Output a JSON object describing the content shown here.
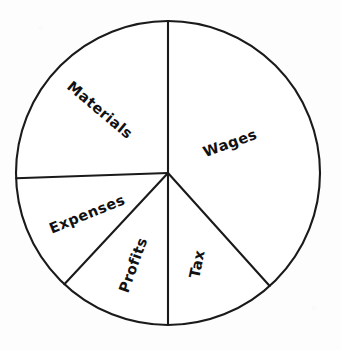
{
  "chart_data": {
    "type": "pie",
    "title": "",
    "subtitle": "",
    "xlabel": "",
    "ylabel": "",
    "grid": false,
    "legend_position": "none",
    "start_angle_deg": 0,
    "direction": "clockwise",
    "categories": [
      "Wages",
      "Tax",
      "Profits",
      "Expenses",
      "Materials"
    ],
    "values": [
      38.3,
      11.7,
      11.9,
      12.5,
      25.6
    ],
    "units": "percent",
    "slices": [
      {
        "label": "Wages",
        "value": 38.3,
        "start_angle_deg": 0,
        "end_angle_deg": 138,
        "sweep_deg": 138,
        "label_rotation_deg": -20,
        "label_x": 230,
        "label_y": 143
      },
      {
        "label": "Tax",
        "value": 11.7,
        "start_angle_deg": 138,
        "end_angle_deg": 180,
        "sweep_deg": 42,
        "label_rotation_deg": -78,
        "label_x": 197,
        "label_y": 264
      },
      {
        "label": "Profits",
        "value": 11.9,
        "start_angle_deg": 180,
        "end_angle_deg": 223,
        "sweep_deg": 43,
        "label_rotation_deg": -70,
        "label_x": 133,
        "label_y": 265
      },
      {
        "label": "Expenses",
        "value": 12.5,
        "start_angle_deg": 223,
        "end_angle_deg": 268,
        "sweep_deg": 45,
        "label_rotation_deg": -22,
        "label_x": 87,
        "label_y": 214
      },
      {
        "label": "Materials",
        "value": 25.6,
        "start_angle_deg": 268,
        "end_angle_deg": 360,
        "sweep_deg": 92,
        "label_rotation_deg": 40,
        "label_x": 100,
        "label_y": 110
      }
    ],
    "geometry": {
      "center_x": 168,
      "center_y": 173,
      "radius": 152
    },
    "style": {
      "stroke_color": "#1a1a1a",
      "fill_color": "#ffffff",
      "background_color": "#fdfdfd",
      "text_color": "#111111"
    }
  }
}
